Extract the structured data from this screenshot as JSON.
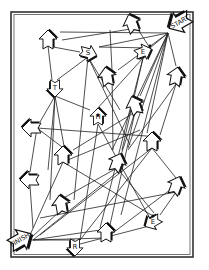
{
  "frame": {
    "x": 11,
    "y": 12,
    "w": 182,
    "h": 245
  },
  "nodes": [
    {
      "id": "start",
      "label": "START",
      "x": 180,
      "y": 22,
      "rot": 150,
      "size": 1.25
    },
    {
      "id": "n_tl",
      "label": "",
      "x": 48,
      "y": 40,
      "rot": -90,
      "size": 1
    },
    {
      "id": "n_tc",
      "label": "",
      "x": 132,
      "y": 24,
      "rot": -110,
      "size": 1
    },
    {
      "id": "s",
      "label": "S",
      "x": 88,
      "y": 53,
      "rot": 15,
      "size": 0.9
    },
    {
      "id": "e_top",
      "label": "E",
      "x": 143,
      "y": 52,
      "rot": -20,
      "size": 0.9
    },
    {
      "id": "t",
      "label": "T",
      "x": 55,
      "y": 88,
      "rot": 90,
      "size": 0.9
    },
    {
      "id": "n_mc",
      "label": "",
      "x": 107,
      "y": 77,
      "rot": -100,
      "size": 1
    },
    {
      "id": "h",
      "label": "H",
      "x": 98,
      "y": 117,
      "rot": -90,
      "size": 0.9
    },
    {
      "id": "n_r1",
      "label": "",
      "x": 176,
      "y": 77,
      "rot": -80,
      "size": 1
    },
    {
      "id": "n_mr",
      "label": "",
      "x": 135,
      "y": 106,
      "rot": -110,
      "size": 1
    },
    {
      "id": "n_l1",
      "label": "",
      "x": 32,
      "y": 128,
      "rot": 180,
      "size": 1
    },
    {
      "id": "n_ml",
      "label": "",
      "x": 63,
      "y": 156,
      "rot": -90,
      "size": 1
    },
    {
      "id": "n_c",
      "label": "",
      "x": 117,
      "y": 163,
      "rot": -70,
      "size": 1
    },
    {
      "id": "n_r2",
      "label": "",
      "x": 152,
      "y": 142,
      "rot": -90,
      "size": 1
    },
    {
      "id": "n_l2",
      "label": "",
      "x": 30,
      "y": 180,
      "rot": 180,
      "size": 1
    },
    {
      "id": "n_r3",
      "label": "",
      "x": 176,
      "y": 186,
      "rot": -70,
      "size": 1
    },
    {
      "id": "n_ll",
      "label": "",
      "x": 61,
      "y": 205,
      "rot": -100,
      "size": 1
    },
    {
      "id": "n_lc",
      "label": "",
      "x": 106,
      "y": 233,
      "rot": -90,
      "size": 1
    },
    {
      "id": "e_bot",
      "label": "E",
      "x": 153,
      "y": 222,
      "rot": 150,
      "size": 0.9
    },
    {
      "id": "finish",
      "label": "FINISH",
      "x": 20,
      "y": 240,
      "rot": -30,
      "size": 1.25
    },
    {
      "id": "r",
      "label": "R",
      "x": 75,
      "y": 247,
      "rot": 90,
      "size": 0.9
    }
  ],
  "edges": [
    [
      168,
      33,
      60,
      32
    ],
    [
      168,
      33,
      99,
      47
    ],
    [
      168,
      33,
      150,
      48
    ],
    [
      168,
      33,
      118,
      70
    ],
    [
      168,
      33,
      176,
      66
    ],
    [
      168,
      33,
      140,
      96
    ],
    [
      168,
      33,
      112,
      150
    ],
    [
      168,
      33,
      147,
      133
    ],
    [
      168,
      33,
      121,
      215
    ],
    [
      168,
      33,
      128,
      148
    ],
    [
      137,
      28,
      62,
      40
    ],
    [
      150,
      48,
      99,
      47
    ],
    [
      137,
      28,
      150,
      48
    ],
    [
      48,
      46,
      52,
      80
    ],
    [
      48,
      46,
      80,
      52
    ],
    [
      88,
      57,
      57,
      80
    ],
    [
      88,
      57,
      120,
      110
    ],
    [
      88,
      57,
      130,
      145
    ],
    [
      88,
      57,
      74,
      200
    ],
    [
      55,
      96,
      90,
      110
    ],
    [
      55,
      96,
      40,
      122
    ],
    [
      55,
      96,
      48,
      170
    ],
    [
      55,
      96,
      64,
      146
    ],
    [
      55,
      96,
      50,
      200
    ],
    [
      112,
      70,
      110,
      30
    ],
    [
      112,
      70,
      113,
      150
    ],
    [
      143,
      58,
      96,
      110
    ],
    [
      143,
      58,
      122,
      150
    ],
    [
      143,
      58,
      100,
      228
    ],
    [
      176,
      84,
      160,
      135
    ],
    [
      176,
      84,
      128,
      150
    ],
    [
      135,
      112,
      73,
      150
    ],
    [
      135,
      112,
      120,
      158
    ],
    [
      135,
      112,
      110,
      225
    ],
    [
      37,
      128,
      160,
      137
    ],
    [
      37,
      128,
      30,
      172
    ],
    [
      37,
      128,
      66,
      150
    ],
    [
      98,
      124,
      148,
      215
    ],
    [
      98,
      124,
      80,
      240
    ],
    [
      63,
      162,
      153,
      216
    ],
    [
      63,
      162,
      30,
      235
    ],
    [
      63,
      162,
      140,
      130
    ],
    [
      117,
      168,
      60,
      200
    ],
    [
      117,
      168,
      154,
      213
    ],
    [
      152,
      148,
      176,
      178
    ],
    [
      152,
      148,
      40,
      235
    ],
    [
      152,
      148,
      80,
      240
    ],
    [
      30,
      186,
      33,
      228
    ],
    [
      176,
      192,
      160,
      215
    ],
    [
      176,
      192,
      40,
      218
    ],
    [
      61,
      210,
      32,
      237
    ],
    [
      106,
      238,
      32,
      240
    ],
    [
      106,
      238,
      170,
      190
    ],
    [
      153,
      225,
      80,
      244
    ],
    [
      33,
      240,
      75,
      240
    ],
    [
      33,
      240,
      100,
      230
    ],
    [
      33,
      240,
      120,
      170
    ]
  ],
  "dots": [
    [
      150,
      46
    ],
    [
      153,
      216
    ],
    [
      98,
      115
    ]
  ]
}
